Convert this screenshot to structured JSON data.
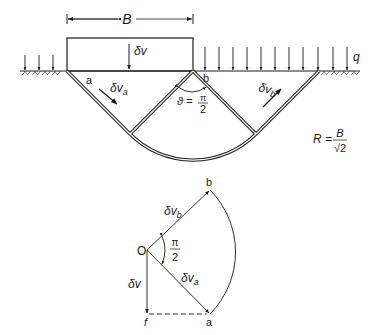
{
  "figure": {
    "mechanism": {
      "footing_width_label": "B",
      "footing_displacement_label": "δv",
      "surcharge_label": "q",
      "wedge_a_label": "a",
      "wedge_b_label": "b",
      "velocity_a_label": "δv",
      "velocity_a_sub": "a",
      "velocity_b_label": "δv",
      "velocity_b_sub": "b",
      "fan_angle_lhs": "ϑ =",
      "fan_angle_num": "π",
      "fan_angle_den": "2",
      "radius_lhs": "R =",
      "radius_num": "B",
      "radius_den": "√2"
    },
    "hodograph": {
      "origin_label": "O",
      "point_b_label": "b",
      "point_a_label": "a",
      "point_f_label": "f",
      "vec_b_label": "δv",
      "vec_b_sub": "b",
      "vec_a_label": "δv",
      "vec_a_sub": "a",
      "vec_v_label": "δv",
      "angle_num": "π",
      "angle_den": "2"
    }
  }
}
